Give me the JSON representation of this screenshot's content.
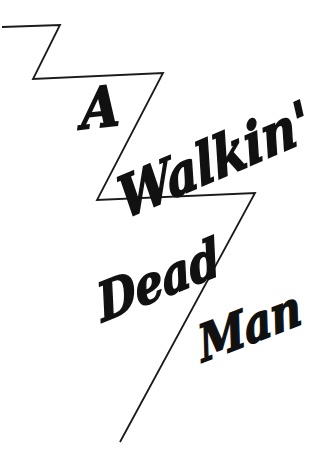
{
  "artwork": {
    "title_text": "A Walkin' Dead Man",
    "background_color": "#ffffff",
    "ink_color": "#111111",
    "words": [
      {
        "id": "a",
        "text": "A"
      },
      {
        "id": "walkin",
        "text": "Walkin'"
      },
      {
        "id": "dead",
        "text": "Dead"
      },
      {
        "id": "man",
        "text": "Man"
      }
    ],
    "bolt": {
      "name": "lightning-bolt-zigzag",
      "stroke_color": "#1a1a1a",
      "stroke_width": 1.8,
      "points": "2,27 60,25 33,79 163,73 97,200 255,193 120,442"
    }
  }
}
